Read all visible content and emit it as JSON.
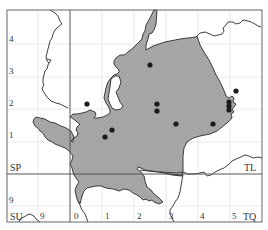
{
  "map": {
    "title": "",
    "grid_squares": {
      "top_left": "SP",
      "top_right": "TL",
      "bottom_left": "SU",
      "bottom_right": "TQ"
    },
    "y_labels": [
      "4",
      "3",
      "2",
      "1",
      "9"
    ],
    "x_labels": [
      "9",
      "0",
      "1",
      "2",
      "3",
      "4",
      "5"
    ],
    "colors": {
      "region_fill": "#a8a8a8",
      "hatch": "#8e8e8e",
      "boundary": "#2a2a2a",
      "grid_major": "#555555",
      "grid_minor": "#e2e2e2",
      "dot": "#1a1a1a",
      "frame": "#666666"
    },
    "records": [
      {
        "x": 150,
        "y": 65
      },
      {
        "x": 87,
        "y": 104
      },
      {
        "x": 157,
        "y": 104
      },
      {
        "x": 157,
        "y": 111
      },
      {
        "x": 236,
        "y": 91
      },
      {
        "x": 229,
        "y": 102
      },
      {
        "x": 229,
        "y": 106
      },
      {
        "x": 229,
        "y": 110
      },
      {
        "x": 176,
        "y": 124
      },
      {
        "x": 213,
        "y": 124
      },
      {
        "x": 112,
        "y": 130
      },
      {
        "x": 105,
        "y": 137
      }
    ]
  }
}
